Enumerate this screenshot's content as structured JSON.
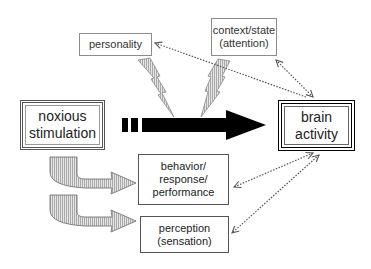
{
  "diagram": {
    "nodes": {
      "personality": {
        "label": "personality"
      },
      "context": {
        "label": "context/state\n(attention)"
      },
      "stimulus": {
        "label": "noxious\nstimulation"
      },
      "brain": {
        "label": "brain\nactivity"
      },
      "behavior": {
        "label": "behavior/\nresponse/\nperformance"
      },
      "perception": {
        "label": "perception\n(sensation)"
      }
    },
    "edges": [
      {
        "from": "stimulus",
        "to": "brain",
        "style": "thick-black-arrow-dashed-tail"
      },
      {
        "from": "personality",
        "to": "main-arrow",
        "style": "lightning-bolt"
      },
      {
        "from": "context",
        "to": "main-arrow",
        "style": "lightning-bolt"
      },
      {
        "from": "brain",
        "to": "personality",
        "style": "dotted-arrow"
      },
      {
        "from": "brain",
        "to": "context",
        "style": "dotted-double-arrow"
      },
      {
        "from": "brain",
        "to": "behavior",
        "style": "dotted-double-arrow"
      },
      {
        "from": "brain",
        "to": "perception",
        "style": "dotted-double-arrow"
      },
      {
        "from": "stimulus",
        "to": "behavior",
        "style": "curved-hatched-arrow"
      },
      {
        "from": "stimulus",
        "to": "perception",
        "style": "curved-hatched-arrow"
      }
    ],
    "colors": {
      "main_arrow": "#000000",
      "hatch_fill": "#c8c8c8",
      "dotted": "#555555",
      "box_border": "#8c8c8c"
    }
  }
}
